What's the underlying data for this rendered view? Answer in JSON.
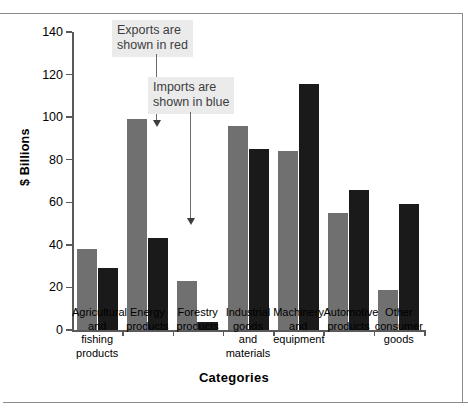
{
  "chart_data": {
    "type": "bar",
    "title": "",
    "xlabel": "Categories",
    "ylabel": "$ Billions",
    "ylim": [
      0,
      140
    ],
    "yticks": [
      0,
      20,
      40,
      60,
      80,
      100,
      120,
      140
    ],
    "grid": false,
    "legend": "none",
    "categories": [
      "Agricultural and fishing products",
      "Energy products",
      "Forestry products",
      "Industrial goods and materials",
      "Machinery and equipment",
      "Automotive products",
      "Other consumer goods"
    ],
    "category_lines": [
      [
        "Agricultural",
        "and fishing",
        "products"
      ],
      [
        "Energy",
        "products"
      ],
      [
        "Forestry",
        "products"
      ],
      [
        "Industrial",
        "goods and",
        "materials"
      ],
      [
        "Machinery",
        "and",
        "equipment"
      ],
      [
        "Automotive",
        "products"
      ],
      [
        "Other",
        "consumer",
        "goods"
      ]
    ],
    "series": [
      {
        "name": "Exports",
        "color": "#707070",
        "values": [
          38,
          99,
          23,
          96,
          84,
          55,
          19
        ]
      },
      {
        "name": "Imports",
        "color": "#1a1a1a",
        "values": [
          29,
          43,
          4,
          85,
          115.5,
          66,
          59
        ]
      }
    ],
    "annotations": [
      {
        "text_lines": [
          "Exports are",
          "shown in red"
        ],
        "points_to": "Exports bar of Energy products"
      },
      {
        "text_lines": [
          "Imports are",
          "shown in blue"
        ],
        "points_to": "Imports bar of Energy products"
      }
    ]
  }
}
